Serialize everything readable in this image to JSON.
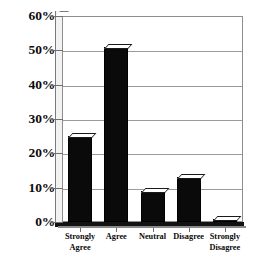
{
  "chart_data": {
    "type": "bar",
    "title": "",
    "subtitle": "",
    "xlabel": "",
    "ylabel": "",
    "categories": [
      "Strongly Agree",
      "Agree",
      "Neutral",
      "Disagree",
      "Strongly Disagree"
    ],
    "values": [
      25,
      51,
      9,
      13,
      1
    ],
    "ylim": [
      0,
      60
    ],
    "ytick_values": [
      0,
      10,
      20,
      30,
      40,
      50,
      60
    ],
    "ytick_labels": [
      "0%",
      "10%",
      "20%",
      "30%",
      "40%",
      "50%",
      "60%"
    ],
    "grid": true,
    "grid_axis": "y",
    "legend": false,
    "legend_position": "none",
    "bar_color": "#0a0a0a",
    "bar_top_color": "#ffffff",
    "grid_color": "#9a9a9a",
    "axis_color": "#7a7a7a",
    "background": "#ffffff",
    "text_color": "#0b0b0b",
    "series": [
      {
        "name": "Response share",
        "values": [
          25,
          51,
          9,
          13,
          1
        ]
      }
    ],
    "points": [
      {
        "category": "Strongly Agree",
        "label": "Strongly\nAgree",
        "value": 25
      },
      {
        "category": "Agree",
        "label": "Agree",
        "value": 51
      },
      {
        "category": "Neutral",
        "label": "Neutral",
        "value": 9
      },
      {
        "category": "Disagree",
        "label": "Disagree",
        "value": 13
      },
      {
        "category": "Strongly Disagree",
        "label": "Strongly\nDisagree",
        "value": 1
      }
    ]
  }
}
